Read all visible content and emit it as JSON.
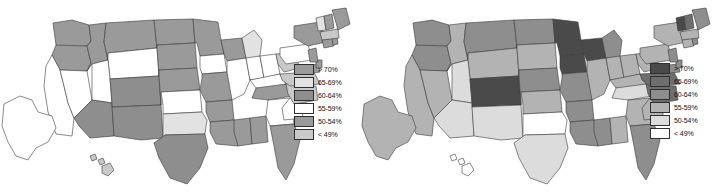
{
  "figure": {
    "type": "choropleth-map-pair",
    "background": "#ffffff",
    "panels": [
      {
        "id": "left-map",
        "name": "us-choropleth-map-left",
        "legend": {
          "name": "legend-left",
          "entries": [
            {
              "label": "> 70%",
              "color": "#9a9a9a"
            },
            {
              "label": "65-69%",
              "color": "#e2e2e2"
            },
            {
              "label": "60-64%",
              "color": "#8e8e8e"
            },
            {
              "label": "55-59%",
              "color": "#ffffff"
            },
            {
              "label": "50-54%",
              "color": "#9a9a9a"
            },
            {
              "label": "< 49%",
              "color": "#c9c9c9"
            }
          ]
        }
      },
      {
        "id": "right-map",
        "name": "us-choropleth-map-right",
        "legend": {
          "name": "legend-right",
          "entries": [
            {
              "label": "> 70%",
              "color": "#4a4a4a"
            },
            {
              "label": "65-69%",
              "color": "#6e6e6e"
            },
            {
              "label": "60-64%",
              "color": "#8e8e8e"
            },
            {
              "label": "55-59%",
              "color": "#b3b3b3"
            },
            {
              "label": "50-54%",
              "color": "#dcdcdc"
            },
            {
              "label": "< 49%",
              "color": "#ffffff"
            }
          ]
        }
      }
    ]
  },
  "chart_data": {
    "type": "heatmap",
    "title": "",
    "xlabel": "",
    "ylabel": "",
    "legend_position": "right",
    "grid": false,
    "categories": [
      "> 70%",
      "65-69%",
      "60-64%",
      "55-59%",
      "50-54%",
      "< 49%"
    ],
    "series": [
      {
        "name": "left-map",
        "state_values": {
          "WA": "> 70%",
          "OR": "> 70%",
          "ID": "> 70%",
          "MT": "> 70%",
          "ND": "> 70%",
          "SD": "> 70%",
          "NE": "> 70%",
          "MN": "> 70%",
          "WI": "> 70%",
          "MI": "65-69%",
          "IA": "55-59%",
          "IL": "55-59%",
          "IN": "55-59%",
          "OH": "55-59%",
          "MO": "> 70%",
          "KS": "55-59%",
          "OK": "65-69%",
          "TX": "60-64%",
          "NM": "60-64%",
          "AZ": "60-64%",
          "CO": "60-64%",
          "UT": "55-59%",
          "NV": "55-59%",
          "CA": "55-59%",
          "WY": "55-59%",
          "AR": "> 70%",
          "LA": "> 70%",
          "MS": "> 70%",
          "AL": "> 70%",
          "TN": "> 70%",
          "KY": "55-59%",
          "GA": "55-59%",
          "FL": "> 70%",
          "SC": "55-59%",
          "NC": "< 49%",
          "VA": "< 49%",
          "WV": "< 49%",
          "MD": "> 70%",
          "DE": "> 70%",
          "PA": "55-59%",
          "NJ": "> 70%",
          "NY": "> 70%",
          "CT": "> 70%",
          "RI": "> 70%",
          "MA": "< 49%",
          "VT": "65-69%",
          "NH": "> 70%",
          "ME": "> 70%",
          "AK": "55-59%",
          "HI": "< 49%"
        }
      },
      {
        "name": "right-map",
        "state_values": {
          "WA": "60-64%",
          "OR": "60-64%",
          "ID": "55-59%",
          "MT": "60-64%",
          "ND": "60-64%",
          "SD": "55-59%",
          "NE": "60-64%",
          "MN": "> 70%",
          "WI": "> 70%",
          "MI": "60-64%",
          "IA": "> 70%",
          "IL": "55-59%",
          "IN": "55-59%",
          "OH": "55-59%",
          "MO": "60-64%",
          "KS": "55-59%",
          "OK": "< 49%",
          "TX": "50-54%",
          "NM": "50-54%",
          "AZ": "50-54%",
          "CO": "> 70%",
          "UT": "50-54%",
          "NV": "55-59%",
          "CA": "55-59%",
          "WY": "55-59%",
          "AR": "60-64%",
          "LA": "60-64%",
          "MS": "60-64%",
          "AL": "55-59%",
          "TN": "50-54%",
          "KY": "55-59%",
          "GA": "55-59%",
          "FL": "60-64%",
          "SC": "55-59%",
          "NC": "65-69%",
          "VA": "65-69%",
          "WV": "55-59%",
          "MD": "60-64%",
          "DE": "60-64%",
          "PA": "55-59%",
          "NJ": "60-64%",
          "NY": "55-59%",
          "CT": "55-59%",
          "RI": "60-64%",
          "MA": "55-59%",
          "VT": "> 70%",
          "NH": "65-69%",
          "ME": "60-64%",
          "AK": "55-59%",
          "HI": "< 49%"
        }
      }
    ]
  }
}
